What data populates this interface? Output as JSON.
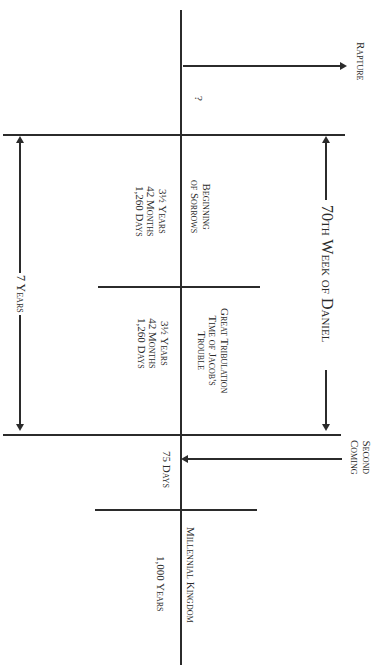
{
  "diagram": {
    "orientation": "rotated 90 degrees clockwise",
    "events": {
      "rapture": "Rapture",
      "rapture_timing": "?",
      "second_coming_line1": "Second",
      "second_coming_line2": "Coming"
    },
    "spans": {
      "seventieth_week": "70th Week of Daniel",
      "seven_years": "7 Years"
    },
    "periods": [
      {
        "name_line1": "Beginning",
        "name_line2": "of Sorrows",
        "name_line3": "",
        "years": "3½ Years",
        "months": "42 Months",
        "days": "1,260 Days"
      },
      {
        "name_line1": "Great Tribulation",
        "name_line2": "Time of Jacob's",
        "name_line3": "Trouble",
        "years": "3½ Years",
        "months": "42 Months",
        "days": "1,260 Days"
      },
      {
        "name_line1": "75 Days"
      },
      {
        "name_line1": "Millennial Kingdom",
        "years": "1,000 Years"
      }
    ],
    "colors": {
      "line": "#2b2b2b",
      "text": "#2a2a2a",
      "background": "#ffffff"
    }
  }
}
